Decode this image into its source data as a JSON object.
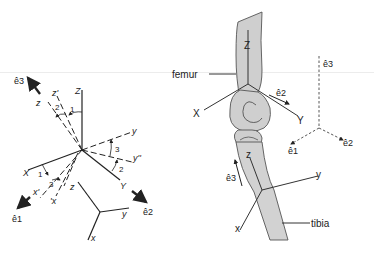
{
  "colors": {
    "line": "#222222",
    "bone_fill": "#cfcfcf",
    "bone_stroke": "#555555",
    "dashed": "#444444"
  },
  "left_panel": {
    "axes_global": {
      "Z": "Z",
      "X": "X",
      "Y": "Y"
    },
    "axes_intermediate": {
      "z_prime": "z'",
      "x_prime": "x'",
      "y_double_prime": "y''",
      "x_prime_alt": "'x"
    },
    "axes_rotated": {
      "z": "z",
      "y": "y"
    },
    "angle_labels": {
      "a1_top": "1",
      "a2_top": "2",
      "a3_right": "3",
      "a2_right": "2",
      "a1_left": "1",
      "a3_left": "3"
    },
    "unit_vectors": {
      "e3": "ê3",
      "e1": "ê1",
      "e2": "ê2"
    },
    "small_frame": {
      "z": "z",
      "y": "y",
      "x": "x"
    }
  },
  "right_panel": {
    "femur_label": "femur",
    "tibia_label": "tibia",
    "femur_axes": {
      "Z": "Z",
      "X": "X",
      "Y": "Y"
    },
    "tibia_axes": {
      "z": "z",
      "y": "y",
      "x": "x"
    },
    "unit_vectors": {
      "e2_femur": "ê2",
      "e3_tibia": "ê3"
    },
    "reference_frame": {
      "e3": "ê3",
      "e1": "ê1",
      "e2": "ê2"
    }
  }
}
